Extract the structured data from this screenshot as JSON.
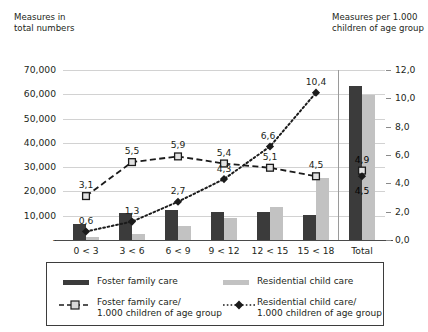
{
  "chart_data": {
    "type": "bar",
    "title": "",
    "subtitle": "",
    "categories": [
      "0 < 3",
      "3 < 6",
      "6 < 9",
      "9 < 12",
      "12 < 15",
      "15 < 18",
      "Total"
    ],
    "left_axis": {
      "label": "Measures in\ntotal numbers",
      "ticks": [
        "-",
        "10,000",
        "20,000",
        "30,000",
        "40,000",
        "50,000",
        "60,000",
        "70,000"
      ],
      "tick_values": [
        0,
        10000,
        20000,
        30000,
        40000,
        50000,
        60000,
        70000
      ],
      "ylim": [
        0,
        70000
      ]
    },
    "right_axis": {
      "label": "Measures per 1.000\nchildren of age group",
      "ticks": [
        "0,0",
        "2,0",
        "4,0",
        "6,0",
        "8,0",
        "10,0",
        "12,0"
      ],
      "tick_values": [
        0,
        2,
        4,
        6,
        8,
        10,
        12
      ],
      "ylim": [
        0,
        12
      ]
    },
    "grid": true,
    "legend_position": "bottom",
    "series": [
      {
        "name": "Foster family care",
        "type": "bar",
        "axis": "left",
        "color": "#3b3b3b",
        "values": [
          6400,
          11100,
          12200,
          11600,
          11500,
          10300,
          63500
        ],
        "labels": [
          "",
          "",
          "",
          "",
          "",
          "",
          ""
        ]
      },
      {
        "name": "Residential child care",
        "type": "bar",
        "axis": "left",
        "color": "#c2c2c2",
        "values": [
          1300,
          2400,
          5900,
          9000,
          13500,
          25700,
          59900
        ],
        "labels": [
          "",
          "",
          "",
          "",
          "",
          "",
          ""
        ]
      },
      {
        "name": "Foster family care/\n1.000 children of age group",
        "type": "line",
        "axis": "right",
        "style": "dashed",
        "marker": "square",
        "color": "#1b1b1b",
        "values": [
          3.1,
          5.5,
          5.9,
          5.4,
          5.1,
          4.5,
          4.9
        ],
        "labels": [
          "3,1",
          "5,5",
          "5,9",
          "5,4",
          "5,1",
          "4,5",
          "4,9"
        ]
      },
      {
        "name": "Residential child care/\n1.000 children of age group",
        "type": "line",
        "axis": "right",
        "style": "dotted",
        "marker": "diamond",
        "color": "#1b1b1b",
        "values": [
          0.6,
          1.3,
          2.7,
          4.3,
          6.6,
          10.4,
          4.5
        ],
        "labels": [
          "0,6",
          "1,3",
          "2,7",
          "4,3",
          "6,6",
          "10,4",
          "4,5"
        ]
      }
    ]
  },
  "legend": {
    "items": [
      {
        "label": "Foster family care",
        "kind": "bar",
        "color": "#3b3b3b"
      },
      {
        "label": "Residential child care",
        "kind": "bar",
        "color": "#c2c2c2"
      },
      {
        "label": "Foster family care/\n1.000 children of age group",
        "kind": "line-square-dashed",
        "color": "#1b1b1b"
      },
      {
        "label": "Residential child care/\n1.000 children of age group",
        "kind": "line-diamond-dotted",
        "color": "#1b1b1b"
      }
    ]
  },
  "colors": {
    "foster_bar": "#3b3b3b",
    "residential_bar": "#c2c2c2",
    "line": "#1b1b1b",
    "grid": "#d2d2d2",
    "axis": "#4a4a4a",
    "background": "#ffffff"
  }
}
